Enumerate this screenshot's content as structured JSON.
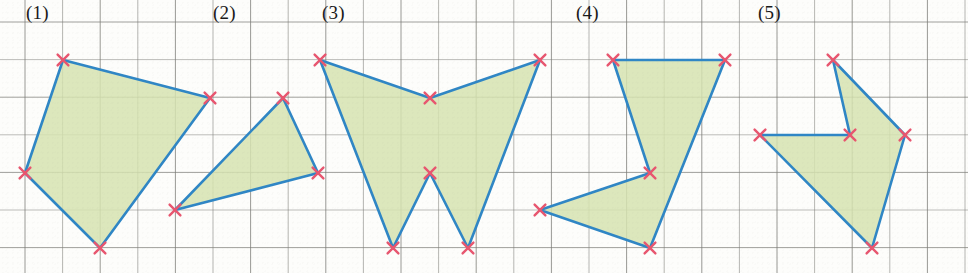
{
  "worksheet": {
    "title": "Polygon area on grid paper exercise",
    "description": "Five shaded polygons drawn on square grid paper, each vertex marked with a red cross.",
    "canvas": {
      "width": 968,
      "height": 273
    },
    "grid": {
      "origin_x": 25,
      "origin_y": 22,
      "cell_size": 37.6,
      "line_color": "#7d7d78",
      "line_width": 1,
      "background": "#fdfdfb",
      "columns": 26,
      "rows": 7
    },
    "style": {
      "fill_color": "#d6e3b0",
      "stroke_color": "#2f86c5",
      "stroke_width": 2.6,
      "vertex_marker_color": "#e8566f",
      "vertex_marker": "x-cross",
      "label_color": "#1a1a1a"
    },
    "figures": [
      {
        "label": "(1)",
        "label_x": 26,
        "label_y": 3,
        "vertex_count": 4,
        "points": "63,60 210,98 100,248 25,173"
      },
      {
        "label": "(2)",
        "label_x": 213,
        "label_y": 3,
        "vertex_count": 3,
        "points": "283,98 318,173 175,210"
      },
      {
        "label": "(3)",
        "label_x": 322,
        "label_y": 3,
        "vertex_count": 6,
        "points": "320,60 430,98 540,60 468,248 430,173 393,248"
      },
      {
        "label": "(4)",
        "label_x": 576,
        "label_y": 3,
        "vertex_count": 5,
        "points": "613,60 725,60 650,248 540,210 650,173"
      },
      {
        "label": "(5)",
        "label_x": 758,
        "label_y": 3,
        "vertex_count": 5,
        "points": "833,60 905,135 872,248 760,135 850,135"
      }
    ],
    "all_vertices": [
      [
        63,
        60
      ],
      [
        210,
        98
      ],
      [
        100,
        248
      ],
      [
        25,
        173
      ],
      [
        283,
        98
      ],
      [
        318,
        173
      ],
      [
        175,
        210
      ],
      [
        320,
        60
      ],
      [
        430,
        98
      ],
      [
        540,
        60
      ],
      [
        468,
        248
      ],
      [
        430,
        173
      ],
      [
        393,
        248
      ],
      [
        613,
        60
      ],
      [
        725,
        60
      ],
      [
        650,
        248
      ],
      [
        540,
        210
      ],
      [
        650,
        173
      ],
      [
        833,
        60
      ],
      [
        905,
        135
      ],
      [
        872,
        248
      ],
      [
        760,
        135
      ],
      [
        850,
        135
      ]
    ]
  }
}
